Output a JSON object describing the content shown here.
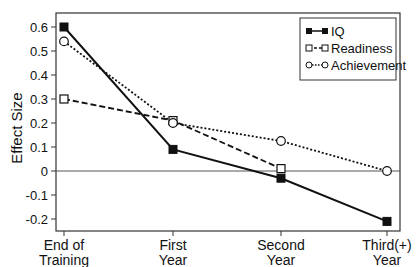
{
  "chart_data": {
    "type": "line",
    "title": "",
    "xlabel": "",
    "ylabel": "Effect Size",
    "categories": [
      "End of\nTraining",
      "First\nYear",
      "Second\nYear",
      "Third(+)\nYear"
    ],
    "category_lines": [
      [
        "End of",
        "Training"
      ],
      [
        "First",
        "Year"
      ],
      [
        "Second",
        "Year"
      ],
      [
        "Third(+)",
        "Year"
      ]
    ],
    "ylim": [
      -0.25,
      0.65
    ],
    "yticks": [
      0.6,
      0.5,
      0.4,
      0.3,
      0.2,
      0.1,
      0,
      -0.1,
      -0.2
    ],
    "ytick_labels": [
      "0.6",
      "0.5",
      "0.4",
      "0.3",
      "0.2",
      "0.1",
      "0",
      "-0.1",
      "-0.2"
    ],
    "grid": false,
    "reference_line_y": 0,
    "legend_position": "upper right",
    "series": [
      {
        "name": "IQ",
        "values": [
          0.6,
          0.09,
          -0.03,
          -0.21
        ],
        "marker": "filled-square",
        "line": "solid"
      },
      {
        "name": "Readiness",
        "values": [
          0.3,
          0.21,
          0.01,
          null
        ],
        "marker": "open-square",
        "line": "dashed"
      },
      {
        "name": "Achievement",
        "values": [
          0.54,
          0.2,
          0.125,
          0.0
        ],
        "marker": "open-circle",
        "line": "dotted"
      }
    ]
  },
  "colors": {
    "line": "#111111",
    "axis": "#333333",
    "background": "#ffffff"
  }
}
